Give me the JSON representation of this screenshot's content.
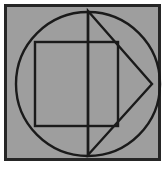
{
  "figure": {
    "title": "Geometric construction: circle with inscribed rectangle and triangle",
    "canvas": {
      "width": 167,
      "height": 170,
      "outer_background_color": "#ffffff",
      "panel_background_color": "#9e9e9e",
      "frame_border_color": "#262626",
      "stroke_color": "#1a1a1a"
    },
    "frame": {
      "label": "outer-frame",
      "x": 4,
      "y": 4,
      "width": 157,
      "height": 157,
      "border_width": 3
    },
    "panel": {
      "label": "gray-panel",
      "x": 7,
      "y": 7,
      "width": 151,
      "height": 151,
      "fill": "#9e9e9e"
    },
    "shapes": [
      {
        "name": "circle",
        "type": "circle",
        "center_x": 88,
        "center_y": 84,
        "radius": 72,
        "stroke_width": 2.4,
        "fill": "none"
      },
      {
        "name": "rectangle",
        "type": "rect",
        "x": 35,
        "y": 42,
        "width": 83,
        "height": 84,
        "stroke_width": 2.4,
        "fill": "none"
      },
      {
        "name": "triangle",
        "type": "polygon",
        "points": "88,11 152,84 88,155",
        "stroke_width": 2.4,
        "fill": "none"
      },
      {
        "name": "vertical-axis",
        "type": "line",
        "x1": 88,
        "y1": 11,
        "x2": 88,
        "y2": 155,
        "stroke_width": 2.4
      }
    ],
    "vertices": {
      "circle_top": [
        88,
        11
      ],
      "circle_bottom": [
        88,
        155
      ],
      "circle_left": [
        20,
        84
      ],
      "circle_right": [
        152,
        84
      ],
      "rect_top_left": [
        35,
        42
      ],
      "rect_top_right": [
        118,
        42
      ],
      "rect_bottom_left": [
        35,
        126
      ],
      "rect_bottom_right": [
        118,
        126
      ],
      "triangle_apex_right": [
        152,
        84
      ]
    }
  }
}
